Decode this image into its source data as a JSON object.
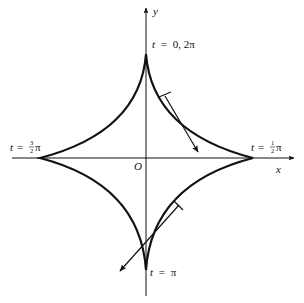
{
  "diagram": {
    "type": "astroid (hypocycloid with four cusps)",
    "axes": {
      "x_label": "x",
      "y_label": "y",
      "origin_label": "O"
    },
    "cusp_labels": {
      "top": {
        "t": "t",
        "eq": "=",
        "value": "0, 2π"
      },
      "right": {
        "t": "t",
        "eq": "=",
        "num": "1",
        "den": "2",
        "pi": "π"
      },
      "left": {
        "t": "t",
        "eq": "=",
        "num": "3",
        "den": "2",
        "pi": "π"
      },
      "bottom": {
        "t": "t",
        "eq": "=",
        "value": "π"
      }
    },
    "tangent_vectors": [
      {
        "quadrant": "upper-right",
        "direction": "down-right"
      },
      {
        "quadrant": "lower-right",
        "direction": "down-left"
      }
    ],
    "colors": {
      "stroke": "#111111",
      "background": "#ffffff"
    }
  }
}
